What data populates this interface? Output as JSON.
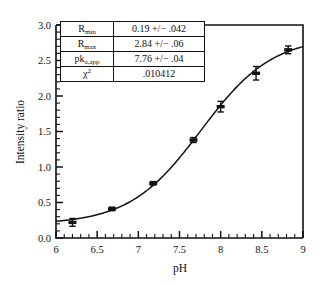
{
  "chart_data": {
    "type": "scatter",
    "title": "",
    "xlabel": "pH",
    "ylabel": "Intensity ratio",
    "xlim": [
      6,
      9
    ],
    "ylim": [
      0,
      3.0
    ],
    "grid": false,
    "legend": "none",
    "x_ticks": [
      "6",
      "6.5",
      "7",
      "7.5",
      "8",
      "8.5",
      "9"
    ],
    "x_tick_values": [
      6,
      6.5,
      7,
      7.5,
      8,
      8.5,
      9
    ],
    "y_ticks": [
      "0.0",
      "0.5",
      "1.0",
      "1.5",
      "2.0",
      "2.5",
      "3.0"
    ],
    "y_tick_values": [
      0,
      0.5,
      1.0,
      1.5,
      2.0,
      2.5,
      3.0
    ],
    "x_minor_step": 0.1,
    "y_minor_step": 0.1,
    "series": [
      {
        "name": "Intensity ratio vs pH",
        "marker": "square-with-errorbars",
        "x": [
          6.2,
          6.68,
          7.18,
          7.67,
          8.0,
          8.43,
          8.82
        ],
        "values": [
          0.22,
          0.41,
          0.77,
          1.38,
          1.85,
          2.32,
          2.65
        ],
        "yerr": [
          0.055,
          0.025,
          0.025,
          0.035,
          0.075,
          0.095,
          0.055
        ]
      },
      {
        "name": "sigmoidal fit",
        "type": "line",
        "model": "R = Rmin + (Rmax - Rmin)/(1 + 10^(pka_app - pH))",
        "Rmin": 0.19,
        "Rmax": 2.84,
        "pka_app": 7.76
      }
    ]
  },
  "inset_table": {
    "name": "fit-parameters",
    "rows": [
      {
        "label_main": "R",
        "label_sub": "min",
        "label_sup": "",
        "value": "0.19 +/− .042"
      },
      {
        "label_main": "R",
        "label_sub": "max",
        "label_sup": "",
        "value": "2.84 +/− .06"
      },
      {
        "label_main": "pk",
        "label_sub": "a,app",
        "label_sup": "",
        "value": "7.76 +/− .04"
      },
      {
        "label_main": "χ",
        "label_sub": "",
        "label_sup": "2",
        "value": ".010412"
      }
    ]
  },
  "colors": {
    "ink": "#111111",
    "background": "#ffffff"
  }
}
